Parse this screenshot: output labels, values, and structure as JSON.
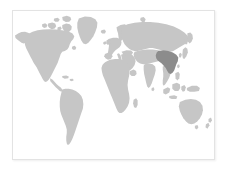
{
  "widget": {
    "name": "world-map",
    "title": "World map",
    "background_color": "#ffffff",
    "border_color": "#e3e3e3",
    "shadow": true
  },
  "map": {
    "projection": "equirectangular",
    "land_color": "#c6c6c6",
    "highlight_color": "#8c8c8c",
    "ocean_color": "#ffffff",
    "highlighted_regions": [
      {
        "name": "China",
        "code": "CN",
        "color": "#8c8c8c"
      }
    ],
    "regions": [
      {
        "name": "North America",
        "color": "#c6c6c6"
      },
      {
        "name": "Greenland",
        "color": "#c6c6c6"
      },
      {
        "name": "South America",
        "color": "#c6c6c6"
      },
      {
        "name": "Europe",
        "color": "#c6c6c6"
      },
      {
        "name": "Africa",
        "color": "#c6c6c6"
      },
      {
        "name": "Asia",
        "color": "#c6c6c6"
      },
      {
        "name": "Australia",
        "color": "#c6c6c6"
      },
      {
        "name": "New Zealand",
        "color": "#c6c6c6"
      },
      {
        "name": "Indonesia",
        "color": "#c6c6c6"
      },
      {
        "name": "Japan",
        "color": "#c6c6c6"
      },
      {
        "name": "Madagascar",
        "color": "#c6c6c6"
      },
      {
        "name": "United Kingdom",
        "color": "#c6c6c6"
      },
      {
        "name": "Iceland",
        "color": "#c6c6c6"
      },
      {
        "name": "Sri Lanka",
        "color": "#c6c6c6"
      },
      {
        "name": "Philippines",
        "color": "#c6c6c6"
      },
      {
        "name": "Cuba",
        "color": "#c6c6c6"
      }
    ],
    "labels": []
  }
}
